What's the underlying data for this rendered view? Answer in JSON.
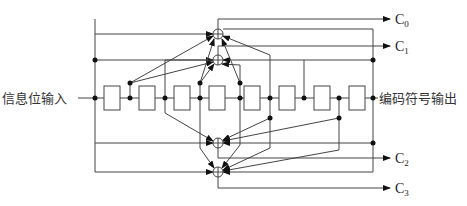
{
  "diagram": {
    "type": "convolutional-encoder",
    "input_label": "信息位输入",
    "output_label": "编码符号输出",
    "register_count": 8,
    "xor_count": 4,
    "outputs": [
      {
        "name": "C",
        "sub": "0"
      },
      {
        "name": "C",
        "sub": "1"
      },
      {
        "name": "C",
        "sub": "2"
      },
      {
        "name": "C",
        "sub": "3"
      }
    ],
    "colors": {
      "line": "#444444",
      "dot": "#111111",
      "text": "#333333",
      "background": "#ffffff"
    }
  }
}
